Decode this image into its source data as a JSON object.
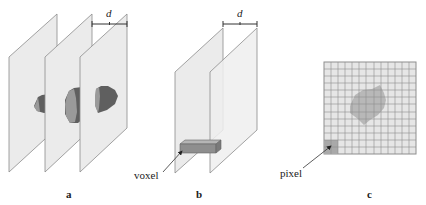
{
  "figure": {
    "panels": [
      {
        "id": "a",
        "label": "a",
        "description": "Three parallel image slices through a 3D object, separated by distance d",
        "dimension_label": "d",
        "slice_count": 3
      },
      {
        "id": "b",
        "label": "b",
        "description": "Two parallel slices separated by d with a voxel spanning between them",
        "dimension_label": "d",
        "callout": "voxel"
      },
      {
        "id": "c",
        "label": "c",
        "description": "Single 2D slice shown as a pixel grid with object cross-section",
        "callout": "pixel",
        "grid": {
          "rows": 13,
          "cols": 13
        }
      }
    ]
  },
  "colors": {
    "plane_fill": "#ebebeb",
    "plane_stroke": "#8c8c8c",
    "object_dark": "#5f5f5f",
    "object_light": "#9a9a9a",
    "grid_fill": "#e6e6e6",
    "grid_line": "#8e8e8e",
    "blob_fill": "#b8b8b8",
    "pixel_highlight": "#a9a9a9",
    "text": "#222222"
  }
}
